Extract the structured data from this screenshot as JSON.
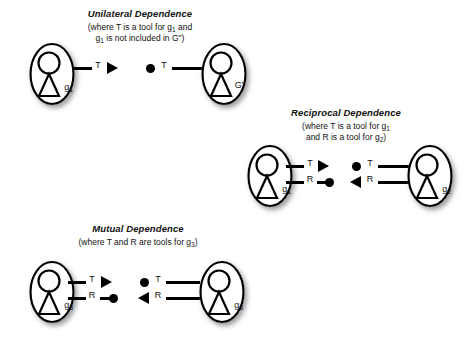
{
  "figure": {
    "background_color": "#ffffff",
    "ink_color": "#000000"
  },
  "diagrams": [
    {
      "id": "unilateral-dependence",
      "title": "Unilateral Dependence",
      "subtitle_line1": "(where T is a tool for g",
      "subtitle_line1_sub": "1",
      "subtitle_line1_tail": " and",
      "subtitle_line2_head": "g",
      "subtitle_line2_sub": "1",
      "subtitle_line2_tail": " is not included in G\")",
      "left_actor": {
        "name": "g",
        "subscript": "1"
      },
      "right_actor": {
        "name": "G\"",
        "subscript": ""
      },
      "links": [
        {
          "left_label": "T",
          "right_label": "T",
          "left_end": "arrow-right",
          "right_end": "dot"
        }
      ]
    },
    {
      "id": "reciprocal-dependence",
      "title": "Reciprocal Dependence",
      "subtitle_line1": "(where T is a tool for g",
      "subtitle_line1_sub": "1",
      "subtitle_line1_tail": "",
      "subtitle_line2_head": "and R is a tool for g",
      "subtitle_line2_sub": "2",
      "subtitle_line2_tail": ")",
      "left_actor": {
        "name": "g",
        "subscript": "1"
      },
      "right_actor": {
        "name": "g",
        "subscript": "2"
      },
      "links": [
        {
          "left_label": "T",
          "right_label": "T",
          "left_end": "arrow-right",
          "right_end": "dot"
        },
        {
          "left_label": "R",
          "right_label": "R",
          "left_end": "dot",
          "right_end": "arrow-left"
        }
      ]
    },
    {
      "id": "mutual-dependence",
      "title": "Mutual Dependence",
      "subtitle_line1": "(where T and R are tools for g",
      "subtitle_line1_sub": "3",
      "subtitle_line1_tail": ")",
      "subtitle_line2_head": "",
      "subtitle_line2_sub": "",
      "subtitle_line2_tail": "",
      "left_actor": {
        "name": "g",
        "subscript": "3"
      },
      "right_actor": {
        "name": "g",
        "subscript": "3"
      },
      "links": [
        {
          "left_label": "T",
          "right_label": "T",
          "left_end": "arrow-right",
          "right_end": "dot"
        },
        {
          "left_label": "R",
          "right_label": "R",
          "left_end": "dot",
          "right_end": "arrow-left"
        }
      ]
    }
  ]
}
